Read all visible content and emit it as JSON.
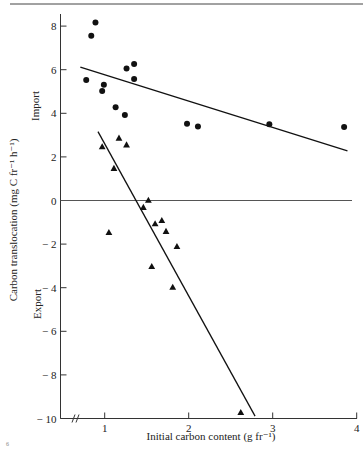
{
  "chart_data": {
    "type": "scatter",
    "title": "",
    "xlabel": "Initial carbon content (g fr⁻¹)",
    "ylabel": "Carbon translocation (mg C fr⁻¹ h⁻¹)",
    "region_labels": {
      "upper": "Import",
      "lower": "Export"
    },
    "xlim": [
      0.5,
      4
    ],
    "ylim": [
      -10,
      8.5
    ],
    "x_ticks": [
      1,
      2,
      3,
      4
    ],
    "y_ticks": [
      8,
      6,
      4,
      2,
      0,
      -2,
      -4,
      -6,
      -8,
      -10
    ],
    "y_tick_labels": [
      "8",
      "6",
      "4",
      "2",
      "0",
      "− 2",
      "− 4",
      "− 6",
      "− 8",
      "− 10"
    ],
    "x_axis_break": true,
    "grid": false,
    "zero_line": true,
    "legend": null,
    "series": [
      {
        "name": "Import",
        "marker": "circle",
        "points": [
          {
            "x": 0.89,
            "y": 8.17
          },
          {
            "x": 0.84,
            "y": 7.56
          },
          {
            "x": 0.78,
            "y": 5.53
          },
          {
            "x": 0.99,
            "y": 5.31
          },
          {
            "x": 0.97,
            "y": 5.02
          },
          {
            "x": 1.26,
            "y": 6.06
          },
          {
            "x": 1.35,
            "y": 6.26
          },
          {
            "x": 1.35,
            "y": 5.57
          },
          {
            "x": 1.13,
            "y": 4.28
          },
          {
            "x": 1.24,
            "y": 3.92
          },
          {
            "x": 1.98,
            "y": 3.52
          },
          {
            "x": 2.11,
            "y": 3.39
          },
          {
            "x": 2.96,
            "y": 3.5
          },
          {
            "x": 3.85,
            "y": 3.37
          }
        ],
        "fit_line": {
          "x1": 0.71,
          "y1": 6.12,
          "x2": 3.89,
          "y2": 2.28
        }
      },
      {
        "name": "Export",
        "marker": "triangle",
        "points": [
          {
            "x": 0.97,
            "y": 2.47
          },
          {
            "x": 1.17,
            "y": 2.87
          },
          {
            "x": 1.26,
            "y": 2.56
          },
          {
            "x": 1.11,
            "y": 1.48
          },
          {
            "x": 1.52,
            "y": 0.02
          },
          {
            "x": 1.46,
            "y": -0.31
          },
          {
            "x": 1.05,
            "y": -1.46
          },
          {
            "x": 1.6,
            "y": -1.06
          },
          {
            "x": 1.68,
            "y": -0.91
          },
          {
            "x": 1.73,
            "y": -1.41
          },
          {
            "x": 1.86,
            "y": -2.1
          },
          {
            "x": 1.56,
            "y": -3.02
          },
          {
            "x": 1.81,
            "y": -3.97
          },
          {
            "x": 2.62,
            "y": -9.72
          }
        ],
        "fit_line": {
          "x1": 0.92,
          "y1": 3.16,
          "x2": 2.79,
          "y2": -9.89
        }
      }
    ]
  },
  "figure": {
    "corner_mark": "6"
  }
}
